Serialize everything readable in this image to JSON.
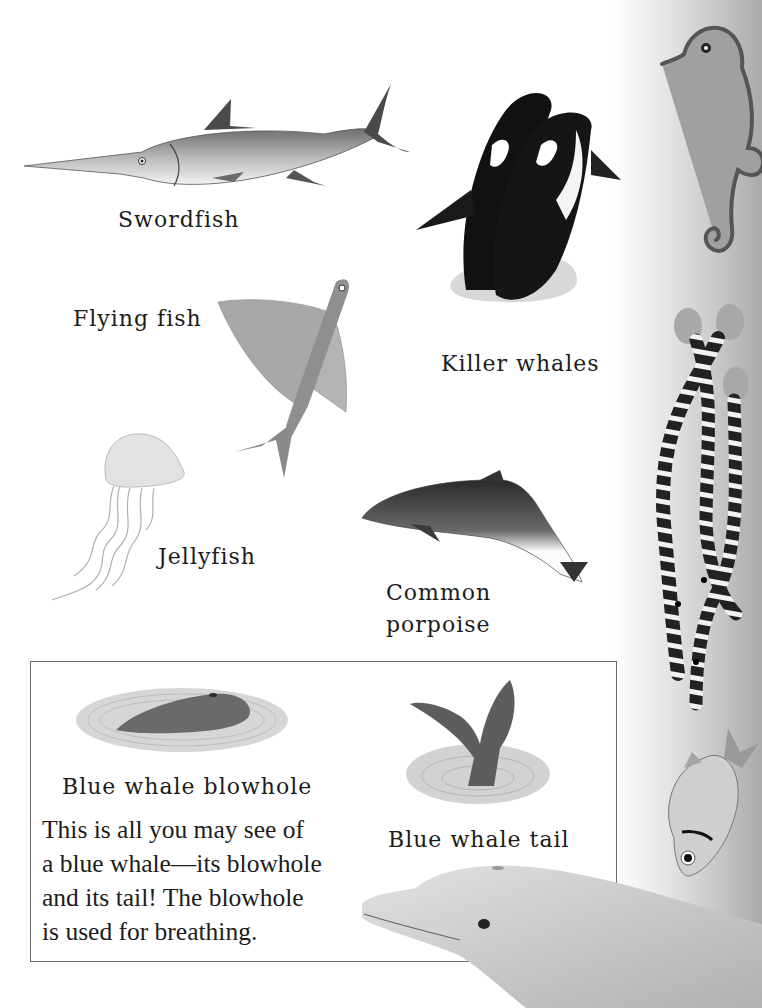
{
  "page": {
    "background": "#ffffff",
    "sidebar_gradient": [
      "#ffffff",
      "#a9a9a9"
    ]
  },
  "animals": [
    {
      "id": "swordfish",
      "label": "Swordfish"
    },
    {
      "id": "killer-whales",
      "label": "Killer whales"
    },
    {
      "id": "flying-fish",
      "label": "Flying fish"
    },
    {
      "id": "jellyfish",
      "label": "Jellyfish"
    },
    {
      "id": "common-porpoise",
      "label_line1": "Common",
      "label_line2": "porpoise"
    }
  ],
  "info_box": {
    "blowhole_caption": "Blue whale blowhole",
    "tail_caption": "Blue whale tail",
    "body_lines": [
      "This is all you may see of",
      "a blue whale—its blowhole",
      "and its tail! The blowhole",
      "is used for breathing."
    ]
  },
  "sidebar_illustrations": [
    "seahorse",
    "striped-sea-snakes",
    "silver-fish"
  ],
  "bottom_illustration": "dolphin-head"
}
